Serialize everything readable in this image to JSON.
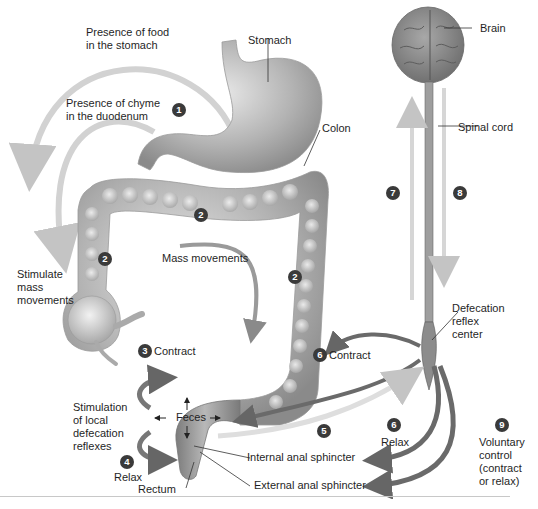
{
  "diagram": {
    "structures": {
      "stomach": "Stomach",
      "colon": "Colon",
      "brain": "Brain",
      "spinal_cord": "Spinal cord",
      "reflex_center": [
        "Defecation",
        "reflex",
        "center"
      ],
      "rectum": "Rectum",
      "internal_sphincter": "Internal anal sphincter",
      "external_sphincter": "External anal sphincter",
      "feces": "Feces"
    },
    "stimuli": {
      "food": [
        "Presence of food",
        "in the stomach"
      ],
      "chyme": [
        "Presence of chyme",
        "in the duodenum"
      ],
      "stimulate": [
        "Stimulate",
        "mass",
        "movements"
      ],
      "mass_movements": "Mass movements",
      "local_reflex": [
        "Stimulation",
        "of local",
        "defecation",
        "reflexes"
      ]
    },
    "actions": {
      "contract_3": "Contract",
      "relax_4": "Relax",
      "contract_6": "Contract",
      "relax_6": "Relax",
      "voluntary": [
        "Voluntary",
        "control",
        "(contract",
        "or relax)"
      ]
    },
    "steps": {
      "s1": "1",
      "s2": "2",
      "s3": "3",
      "s4": "4",
      "s5": "5",
      "s6": "6",
      "s7": "7",
      "s8": "8",
      "s9": "9"
    },
    "colors": {
      "organ_fill": "#b5b5b5",
      "organ_shadow": "#8a8a8a",
      "arrow_light": "#cfcfcf",
      "arrow_dark": "#6a6a6a",
      "badge": "#3a3a3a",
      "brain": "#8c8c8c"
    }
  }
}
